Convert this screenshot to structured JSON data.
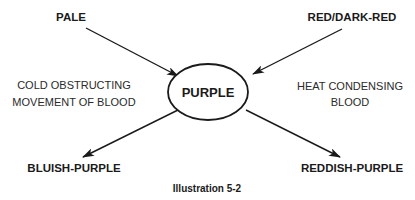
{
  "diagram": {
    "center": {
      "label": "PURPLE"
    },
    "inputs": [
      {
        "label": "PALE"
      },
      {
        "label": "RED/DARK-RED"
      }
    ],
    "outputs": [
      {
        "label": "BLUISH-PURPLE"
      },
      {
        "label": "REDDISH-PURPLE"
      }
    ],
    "causes": {
      "left": {
        "line1": "COLD OBSTRUCTING",
        "line2": "MOVEMENT OF BLOOD"
      },
      "right": {
        "line1": "HEAT CONDENSING",
        "line2": "BLOOD"
      }
    },
    "caption": "Illustration 5-2",
    "colors": {
      "ink": "#1a1a1a",
      "background": "#ffffff"
    }
  }
}
